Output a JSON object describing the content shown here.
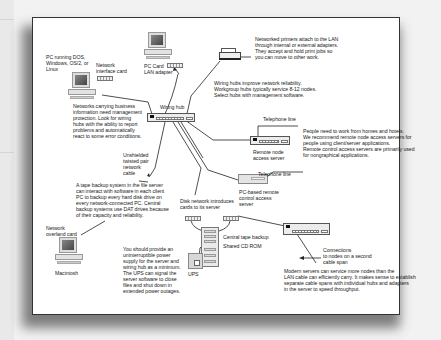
{
  "diagram": {
    "labels": {
      "pc_dos": "PC running DOS,\nWindows, OS/2, or\nLinux",
      "nic": "Network\ninterface card",
      "pc_card": "PC Card\nLAN adapter",
      "printers": "Networked printers attach to the LAN\nthrough internal or external adapters.\nThey accept and hold print jobs so\nyou can move to other work.",
      "hubs_note": "Wiring hubs improve network reliability.\nWorkgroup hubs typically service 8-12 nodes.\nSelect hubs with management software.",
      "wiring_hub": "Wiring hub",
      "management": "Networks carrying business\ninformation need management\nprotection. Look for wiring\nhubs with the ability to report\nproblems and automatically\nreact to some error conditions.",
      "telephone_line_1": "Telephone line",
      "remote_node": "Remote node\naccess server",
      "remote_note": "People need to work from homes and hotels.\nWe recommend remote node access servers for\npeople using client/server applications.\nRemote control access servers are primarily used\nfor nongraphical applications.",
      "utp": "Unshielded\ntwisted pair\nnetwork\ncable",
      "tape_note": "A tape backup system in the file server\ncan interact with software in each client\nPC to backup every hard disk drive on\nevery network-connected PC. Central\nbackup systems use DAT drives because\nof their capacity and reliability.",
      "telephone_line_2": "Telephone line",
      "pc_remote": "PC-based remote\ncontrol access\nserver",
      "disk_net": "Disk network introduces\ncards to its server",
      "central_tape": "Central tape backup",
      "shared_cd": "Shared CD ROM",
      "overlan": "Network\noverland card",
      "mac": "Macintosh",
      "ups_note": "You should provide an\nuninterruptible power\nsupply for the server and\nwiring hub as a minimum.\nThe UPS can signal the\nserver software to close\nfiles and shut down in\nextended power outages.",
      "ups": "UPS",
      "connections": "Connections\nto nodes on a second\ncable span",
      "modern_servers": "Modern servers can service more nodes than the\nLAN cable can efficiently carry. It makes sense to establish\nseparate cable spans with individual hubs and adapters\nin the server to speed throughput."
    },
    "colors": {
      "background": "#f2f2f2",
      "frame": "#ffffff",
      "line": "#222222",
      "text": "#222222"
    }
  }
}
